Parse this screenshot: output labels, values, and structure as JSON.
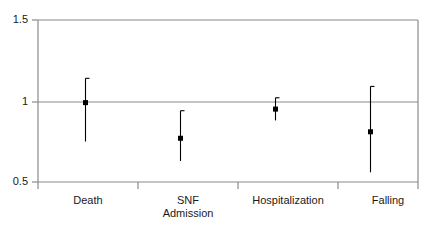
{
  "chart_data": {
    "type": "scatter",
    "title": "",
    "subtitle": "",
    "xlabel": "",
    "ylabel": "",
    "categories": [
      "Death",
      "SNF Admission",
      "Hospitalization",
      "Falling"
    ],
    "category_lines": [
      [
        "Death"
      ],
      [
        "SNF",
        "Admission"
      ],
      [
        "Hospitalization"
      ],
      [
        "Falling"
      ]
    ],
    "values": [
      0.99,
      0.77,
      0.95,
      0.81
    ],
    "ci_low": [
      0.75,
      0.63,
      0.88,
      0.56
    ],
    "ci_high": [
      1.14,
      0.94,
      1.02,
      1.09
    ],
    "ylim": [
      0.5,
      1.5
    ],
    "yticks": [
      0.5,
      1.0,
      1.5
    ],
    "ytick_labels": [
      "0.5",
      "1",
      "1.5"
    ],
    "reference_line": 1.0,
    "grid": false,
    "legend": "none",
    "marker": "filled-square",
    "marker_color": "#000000",
    "line_color": "#000000",
    "axis_color": "#808080",
    "series": [
      {
        "name": "Hazard ratio",
        "points": [
          {
            "category": "Death",
            "value": 0.99,
            "ci_low": 0.75,
            "ci_high": 1.14
          },
          {
            "category": "SNF Admission",
            "value": 0.77,
            "ci_low": 0.63,
            "ci_high": 0.94
          },
          {
            "category": "Hospitalization",
            "value": 0.95,
            "ci_low": 0.88,
            "ci_high": 1.02
          },
          {
            "category": "Falling",
            "value": 0.81,
            "ci_low": 0.56,
            "ci_high": 1.09
          }
        ]
      }
    ]
  }
}
